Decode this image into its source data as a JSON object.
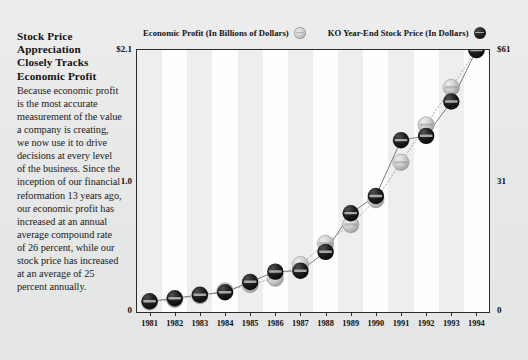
{
  "sidebar": {
    "headline_lines": [
      "Stock Price",
      "Appreciation",
      "Closely Tracks",
      "Economic Profit"
    ],
    "headline": "Stock Price Appreciation Closely Tracks Economic Profit",
    "body": "Because economic profit is the most accurate measurement of the value a company is creating, we now use it to drive decisions at every level of the business. Since the inception of our financial reformation 13 years ago, our economic profit has increased at an annual average compound rate of 26 percent, while our stock price has increased at an average of 25 percent annually."
  },
  "legend": {
    "items": [
      {
        "label": "Economic Profit (In Billions of Dollars)",
        "marker": "light-gray-cap-icon",
        "color": "#c9c9c9"
      },
      {
        "label": "KO Year-End Stock Price (In Dollars)",
        "marker": "dark-bottlecap-icon",
        "color": "#111111"
      }
    ]
  },
  "axes": {
    "left_ticks": [
      "$2.1",
      "1.0",
      "0"
    ],
    "right_ticks": [
      "$61",
      "31",
      "0"
    ],
    "left_title": "Economic Profit (In Billions of Dollars)",
    "right_title": "KO Year-End Stock Price (In Dollars)"
  },
  "chart_data": {
    "type": "line",
    "xlabel": "",
    "ylabel": "Economic Profit (In Billions of Dollars)",
    "y2label": "KO Year-End Stock Price (In Dollars)",
    "grid": false,
    "legend_position": "top",
    "categories": [
      "1981",
      "1982",
      "1983",
      "1984",
      "1985",
      "1986",
      "1987",
      "1988",
      "1989",
      "1990",
      "1991",
      "1992",
      "1993",
      "1994"
    ],
    "x": [
      1981,
      1982,
      1983,
      1984,
      1985,
      1986,
      1987,
      1988,
      1989,
      1990,
      1991,
      1992,
      1993,
      1994
    ],
    "ylim": [
      0,
      2.1
    ],
    "y2lim": [
      0,
      61
    ],
    "yticks": [
      0,
      1.0,
      2.1
    ],
    "y2ticks": [
      0,
      31,
      61
    ],
    "series": [
      {
        "name": "Economic Profit (In Billions of Dollars)",
        "axis": "left",
        "unit": "billions of dollars",
        "marker": "light-gray-cap-icon",
        "color": "#c9c9c9",
        "values": [
          0.08,
          0.1,
          0.13,
          0.17,
          0.22,
          0.27,
          0.38,
          0.55,
          0.7,
          0.9,
          1.2,
          1.5,
          1.8,
          2.1
        ]
      },
      {
        "name": "KO Year-End Stock Price (In Dollars)",
        "axis": "right",
        "unit": "dollars",
        "marker": "dark-bottlecap-icon",
        "color": "#111111",
        "values": [
          2.5,
          3.2,
          4.0,
          4.6,
          7.0,
          9.4,
          9.6,
          14.0,
          23.0,
          27.0,
          40.0,
          41.0,
          49.0,
          61.0
        ]
      }
    ]
  }
}
